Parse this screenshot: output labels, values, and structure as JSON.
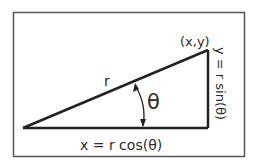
{
  "diagram": {
    "labels": {
      "point": "(x,y)",
      "radius": "r",
      "angle": "θ",
      "x_equation": "x = r cos(θ)",
      "y_equation": "y = r sin(θ)"
    },
    "colors": {
      "stroke": "#222222",
      "border": "#444444",
      "text": "#2b2b2b"
    }
  }
}
